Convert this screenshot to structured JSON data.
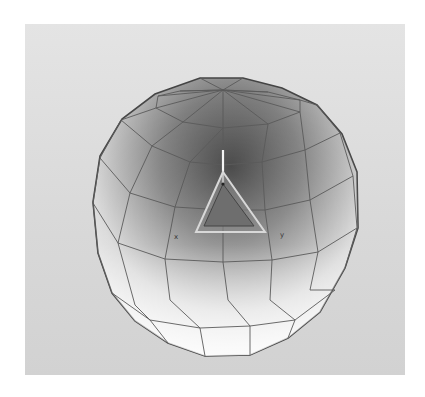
{
  "figure": {
    "type": "3D wireframe shaded sphere (low-poly geosphere) with local axis gizmo",
    "background_color": "#dcdcdc",
    "mesh_line_color": "#555555",
    "gizmo": {
      "axis_labels": {
        "x": "x",
        "y": "y"
      },
      "triangle_fill": "#7a7a7a"
    }
  },
  "captions": {
    "top": "",
    "bottom": ""
  }
}
